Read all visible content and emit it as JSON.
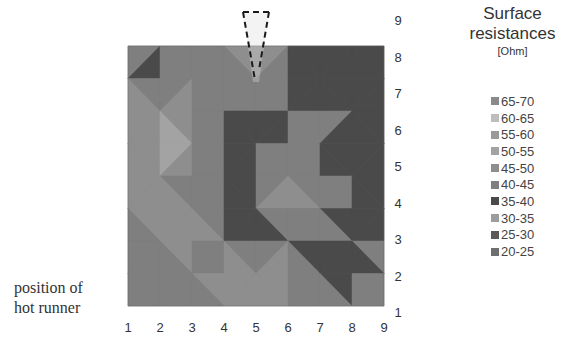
{
  "chart_data": {
    "type": "heatmap",
    "unit_label": "[Ohm]",
    "xlabel": "",
    "ylabel": "",
    "x_ticks": [
      "1",
      "2",
      "3",
      "4",
      "5",
      "6",
      "7",
      "8",
      "9"
    ],
    "y_ticks": [
      "9",
      "8",
      "7",
      "6",
      "5",
      "4",
      "3",
      "2",
      "1"
    ],
    "xlim": [
      1,
      9
    ],
    "ylim": [
      1,
      9
    ],
    "legend_position": "right",
    "annotation": "position of hot runner",
    "hot_runner_x": 5,
    "bins": [
      {
        "label": "65-70",
        "min": 65,
        "max": 70,
        "color": "#8a8a8a"
      },
      {
        "label": "60-65",
        "min": 60,
        "max": 65,
        "color": "#bdbdbd"
      },
      {
        "label": "55-60",
        "min": 55,
        "max": 60,
        "color": "#9a9a9a"
      },
      {
        "label": "50-55",
        "min": 50,
        "max": 55,
        "color": "#a3a3a3"
      },
      {
        "label": "45-50",
        "min": 45,
        "max": 50,
        "color": "#8e8e8e"
      },
      {
        "label": "40-45",
        "min": 40,
        "max": 45,
        "color": "#7f7f7f"
      },
      {
        "label": "35-40",
        "min": 35,
        "max": 40,
        "color": "#4a4a4a"
      },
      {
        "label": "30-35",
        "min": 30,
        "max": 35,
        "color": "#9c9c9c"
      },
      {
        "label": "25-30",
        "min": 25,
        "max": 30,
        "color": "#5a5a5a"
      },
      {
        "label": "20-25",
        "min": 20,
        "max": 25,
        "color": "#6e6e6e"
      }
    ],
    "grid_rows_top_to_bottom_y9_to_y1": [
      [
        42,
        40,
        36,
        40,
        55,
        38,
        36,
        38,
        42
      ],
      [
        42,
        37,
        45,
        38,
        52,
        40,
        36,
        37,
        36
      ],
      [
        42,
        52,
        38,
        42,
        40,
        37,
        44,
        36,
        36
      ],
      [
        42,
        52,
        46,
        38,
        36,
        43,
        40,
        38,
        37
      ],
      [
        42,
        52,
        37,
        40,
        38,
        50,
        38,
        38,
        37
      ],
      [
        42,
        52,
        45,
        37,
        40,
        47,
        44,
        38,
        38
      ],
      [
        42,
        42,
        52,
        40,
        37,
        42,
        40,
        36,
        42
      ],
      [
        42,
        42,
        42,
        52,
        52,
        52,
        37,
        40,
        42
      ],
      [
        42,
        42,
        42,
        42,
        42,
        42,
        42,
        42,
        42
      ]
    ]
  }
}
